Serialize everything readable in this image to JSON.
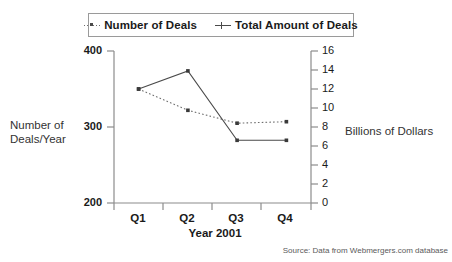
{
  "chart_data": {
    "type": "line",
    "title": "",
    "subtitle": "",
    "xlabel": "Year 2001",
    "ylabel": "Number of Deals/Year",
    "y2label": "Billions of Dollars",
    "categories": [
      "Q1",
      "Q2",
      "Q3",
      "Q4"
    ],
    "ylim": [
      200,
      400
    ],
    "y2lim": [
      0,
      16
    ],
    "yticks": [
      200,
      300,
      400
    ],
    "y2ticks": [
      0,
      2,
      4,
      6,
      8,
      10,
      12,
      14,
      16
    ],
    "grid": false,
    "legend_position": "top",
    "series": [
      {
        "name": "Number of Deals",
        "axis": "left",
        "style": "dotted",
        "marker": "square",
        "color": "#6f6f6f",
        "values": [
          350,
          322,
          305,
          307
        ]
      },
      {
        "name": "Total Amount of Deals",
        "axis": "right",
        "style": "solid",
        "marker": "square",
        "color": "#4a4a4a",
        "values": [
          12.0,
          13.9,
          6.6,
          6.6
        ]
      }
    ],
    "annotations": [
      "Source: Data from Webmergers.com database"
    ]
  },
  "legend": {
    "items": [
      {
        "label": "Number of Deals",
        "marker": "dotted"
      },
      {
        "label": "Total Amount of Deals",
        "marker": "solid"
      }
    ]
  },
  "axes": {
    "left": {
      "title_line1": "Number of",
      "title_line2": "Deals/Year",
      "ticks": [
        "400",
        "300",
        "200"
      ]
    },
    "right": {
      "title": "Billions of Dollars",
      "ticks": [
        "16",
        "14",
        "12",
        "10",
        "8",
        "6",
        "4",
        "2",
        "0"
      ]
    },
    "x": {
      "title": "Year 2001",
      "ticks": [
        "Q1",
        "Q2",
        "Q3",
        "Q4"
      ]
    }
  },
  "footer": {
    "source": "Source: Data from Webmergers.com database"
  },
  "colors": {
    "background": "#ffffff",
    "axis": "#8c8c8c",
    "text": "#1a1a1a",
    "series_dotted": "#6f6f6f",
    "series_solid": "#4a4a4a",
    "legend_border": "#9a9a9a"
  }
}
